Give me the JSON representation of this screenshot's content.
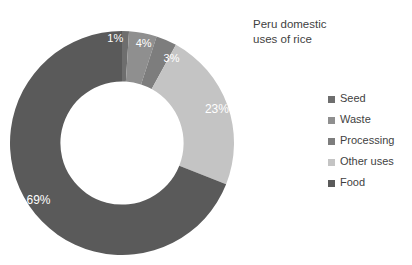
{
  "chart_data": {
    "type": "pie",
    "variant": "donut",
    "title": "Peru domestic\nuses of rice",
    "xlabel": "",
    "ylabel": "",
    "grid": false,
    "legend_position": "right",
    "background": "#ffffff",
    "hole_ratio": 0.55,
    "start_angle_deg": 0,
    "direction": "clockwise",
    "categories": [
      "Seed",
      "Waste",
      "Processing",
      "Other uses",
      "Food"
    ],
    "values": [
      1,
      4,
      3,
      23,
      69
    ],
    "value_labels": [
      "1%",
      "4%",
      "3%",
      "23%",
      "69%"
    ],
    "colors": [
      "#6e6e6e",
      "#8f8f8f",
      "#7d7d7d",
      "#c4c4c4",
      "#5a5a5a"
    ],
    "label_color": "#ffffff",
    "total": 100,
    "units": "percent",
    "slices": [
      {
        "name": "Seed",
        "value": 1,
        "label": "1%",
        "color": "#6e6e6e"
      },
      {
        "name": "Waste",
        "value": 4,
        "label": "4%",
        "color": "#8f8f8f"
      },
      {
        "name": "Processing",
        "value": 3,
        "label": "3%",
        "color": "#7d7d7d"
      },
      {
        "name": "Other uses",
        "value": 23,
        "label": "23%",
        "color": "#c4c4c4"
      },
      {
        "name": "Food",
        "value": 69,
        "label": "69%",
        "color": "#5a5a5a"
      }
    ]
  },
  "title": {
    "text": "Peru domestic\nuses of rice"
  },
  "legend": {
    "items": [
      {
        "label": "Seed",
        "color": "#6e6e6e"
      },
      {
        "label": "Waste",
        "color": "#8f8f8f"
      },
      {
        "label": "Processing",
        "color": "#7d7d7d"
      },
      {
        "label": "Other uses",
        "color": "#c4c4c4"
      },
      {
        "label": "Food",
        "color": "#5a5a5a"
      }
    ]
  }
}
